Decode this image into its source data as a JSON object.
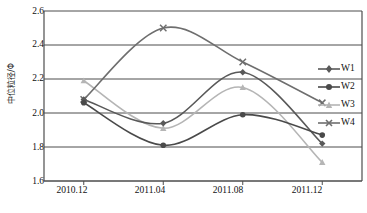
{
  "chart_data": {
    "type": "line",
    "title": "",
    "xlabel": "",
    "ylabel": "中位粒径/Φ",
    "categories": [
      "2010.12",
      "2011.04",
      "2011.08",
      "2011.12"
    ],
    "ylim": [
      1.6,
      2.6
    ],
    "yticks": [
      "2.6",
      "2.4",
      "2.2",
      "2.0",
      "1.8",
      "1.6"
    ],
    "ytick_values": [
      2.6,
      2.4,
      2.2,
      2.0,
      1.8,
      1.6
    ],
    "grid": "horizontal",
    "legend_position": "right",
    "smoothing": "spline",
    "series": [
      {
        "name": "W1",
        "color": "#595959",
        "marker": "diamond",
        "values": [
          2.08,
          1.94,
          2.24,
          1.82
        ]
      },
      {
        "name": "W2",
        "color": "#4a4a4a",
        "marker": "circle",
        "values": [
          2.06,
          1.81,
          1.99,
          1.87
        ]
      },
      {
        "name": "W3",
        "color": "#b5b5b5",
        "marker": "triangle",
        "values": [
          2.19,
          1.91,
          2.15,
          1.71
        ]
      },
      {
        "name": "W4",
        "color": "#6e6e6e",
        "marker": "cross",
        "values": [
          2.08,
          2.5,
          2.3,
          2.06
        ]
      }
    ]
  },
  "axis": {
    "y_label": "中位粒径/Φ",
    "y_ticks": [
      "2.6",
      "2.4",
      "2.2",
      "2.0",
      "1.8",
      "1.6"
    ],
    "x_ticks": [
      "2010.12",
      "2011.04",
      "2011.08",
      "2011.12"
    ]
  },
  "legend": {
    "items": [
      {
        "label": "W1"
      },
      {
        "label": "W2"
      },
      {
        "label": "W3"
      },
      {
        "label": "W4"
      }
    ]
  },
  "colors": {
    "axis": "#4d4d4d",
    "grid": "#4d4d4d",
    "w1": "#595959",
    "w2": "#4a4a4a",
    "w3": "#b5b5b5",
    "w4": "#6e6e6e",
    "background": "#ffffff"
  }
}
